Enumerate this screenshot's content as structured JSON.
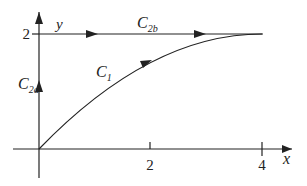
{
  "diagram": {
    "axes": {
      "x_label": "x",
      "y_label": "y",
      "x_ticks": [
        {
          "value": 2,
          "label": "2"
        },
        {
          "value": 4,
          "label": "4"
        }
      ],
      "y_ticks": [
        {
          "value": 2,
          "label": "2"
        }
      ]
    },
    "paths": {
      "c1": {
        "label_main": "C",
        "label_sub": "1",
        "description": "curve from (0,0) to (4,2)"
      },
      "c2a": {
        "label_main": "C",
        "label_sub": "2a",
        "description": "vertical segment from (0,0) to (0,2)"
      },
      "c2b": {
        "label_main": "C",
        "label_sub": "2b",
        "description": "horizontal segment from (0,2) to (4,2)"
      }
    },
    "colors": {
      "stroke": "#222222",
      "background": "#ffffff"
    }
  }
}
